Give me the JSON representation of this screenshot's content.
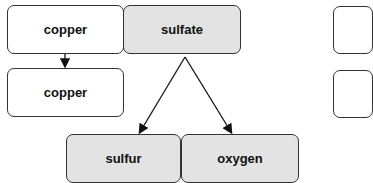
{
  "diagram": {
    "nodes": [
      {
        "id": "copper-top",
        "label": "copper",
        "fill": "#ffffff"
      },
      {
        "id": "sulfate",
        "label": "sulfate",
        "fill": "#e3e3e3"
      },
      {
        "id": "copper-bottom",
        "label": "copper",
        "fill": "#ffffff"
      },
      {
        "id": "sulfur",
        "label": "sulfur",
        "fill": "#e3e3e3"
      },
      {
        "id": "oxygen",
        "label": "oxygen",
        "fill": "#e3e3e3"
      },
      {
        "id": "partial-right-top",
        "label": "",
        "fill": "#ffffff"
      },
      {
        "id": "partial-right-bottom",
        "label": "",
        "fill": "#ffffff"
      }
    ],
    "edges": [
      {
        "from": "copper-top",
        "to": "copper-bottom"
      },
      {
        "from": "sulfate",
        "to": "sulfur"
      },
      {
        "from": "sulfate",
        "to": "oxygen"
      }
    ]
  }
}
